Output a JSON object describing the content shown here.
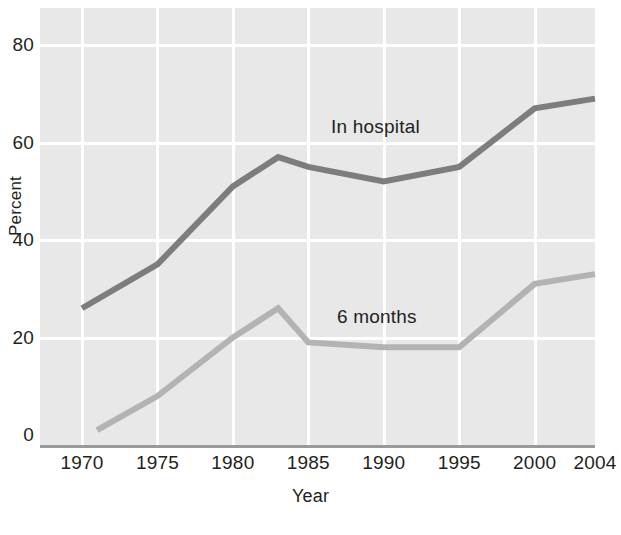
{
  "chart_data": {
    "type": "line",
    "title": "",
    "xlabel": "Year",
    "ylabel": "Percent",
    "xlim": [
      1970,
      2004
    ],
    "ylim": [
      0,
      80
    ],
    "grid": true,
    "legend_position": "inline-annotations",
    "xticks": [
      "1970",
      "1975",
      "1980",
      "1985",
      "1990",
      "1995",
      "2000",
      "2004"
    ],
    "xtick_values": [
      1970,
      1975,
      1980,
      1985,
      1990,
      1995,
      2000,
      2004
    ],
    "yticks": [
      "0",
      "20",
      "40",
      "60",
      "80"
    ],
    "ytick_values": [
      0,
      20,
      40,
      60,
      80
    ],
    "series": [
      {
        "name": "In hospital",
        "color": "#7d7d7d",
        "x": [
          1970,
          1975,
          1980,
          1983,
          1985,
          1990,
          1995,
          2000,
          2004
        ],
        "values": [
          26,
          35,
          51,
          57,
          55,
          52,
          55,
          67,
          69
        ]
      },
      {
        "name": "6 months",
        "color": "#b3b3b3",
        "x": [
          1971,
          1975,
          1980,
          1983,
          1985,
          1990,
          1995,
          2000,
          2004
        ],
        "values": [
          1,
          8,
          20,
          26,
          19,
          18,
          18,
          31,
          33
        ]
      }
    ],
    "annotations": [
      {
        "text": "In hospital",
        "series": "In hospital"
      },
      {
        "text": "6 months",
        "series": "6 months"
      }
    ],
    "colors": {
      "panel_background": "#e8e8e8",
      "gridline": "#ffffff",
      "axis_line": "#9a9a9a",
      "text": "#231f20",
      "page_background": "#ffffff"
    }
  }
}
